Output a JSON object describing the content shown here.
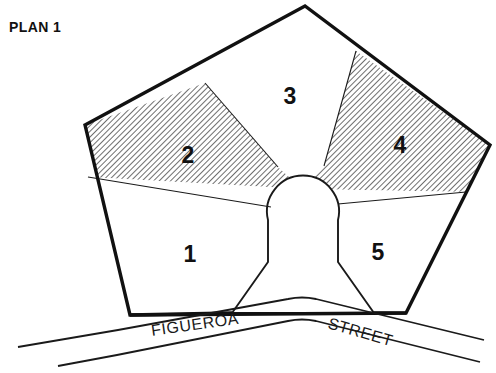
{
  "figure": {
    "title": "PLAN 1",
    "type": "site-plan"
  },
  "parcels": [
    {
      "id": "1",
      "label": "1",
      "fill": "white",
      "label_x": 190,
      "label_y": 262
    },
    {
      "id": "2",
      "label": "2",
      "fill": "hatched",
      "label_x": 188,
      "label_y": 163
    },
    {
      "id": "3",
      "label": "3",
      "fill": "white",
      "label_x": 290,
      "label_y": 104
    },
    {
      "id": "4",
      "label": "4",
      "fill": "hatched",
      "label_x": 400,
      "label_y": 153
    },
    {
      "id": "5",
      "label": "5",
      "fill": "white",
      "label_x": 378,
      "label_y": 260
    }
  ],
  "streets": [
    {
      "name": "FIGUEROA",
      "x": 152,
      "y": 336,
      "rotation": -8
    },
    {
      "name": "STREET",
      "x": 327,
      "y": 328,
      "rotation": 16
    }
  ],
  "colors": {
    "ink": "#111111",
    "line": "#1a1a1a",
    "hatch": "#4a4a4a",
    "background": "#ffffff",
    "hatch_fill": "#d9d9d9"
  },
  "geometry": {
    "block_outline": "85,125 305,6 490,145 406,313 130,315",
    "circle": {
      "cx": 303,
      "cy": 189,
      "r": 36
    },
    "courtyard_stem": "268,220 268,262 232,313 374,313 338,262 338,220",
    "divider_1_2": "88,177 271,207",
    "divider_2_3": "205,83 278,167",
    "divider_3_4": "356,51 324,166",
    "divider_4_5": "338,204 466,192",
    "curb_upper": "18,347 118,330 290,299 318,298 484,340",
    "curb_lower": "58,366 117,355 290,320 318,320 480,362"
  }
}
